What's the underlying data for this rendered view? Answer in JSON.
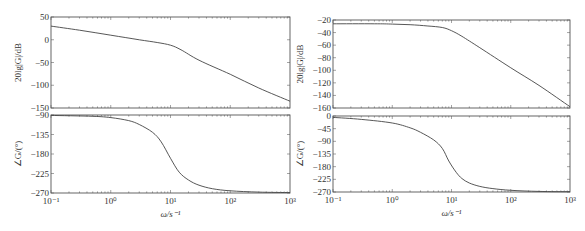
{
  "chart_data": [
    {
      "type": "line",
      "panel": "left-magnitude",
      "title": "",
      "xlabel": "",
      "ylabel": "20lg|G|/dB",
      "xscale": "log",
      "xlim": [
        0.1,
        1000
      ],
      "ylim": [
        -150,
        50
      ],
      "yticks": [
        50,
        0,
        -50,
        -100,
        -150
      ],
      "grid": false,
      "series": [
        {
          "name": "magnitude",
          "x": [
            0.1,
            0.3,
            1,
            3,
            6,
            10,
            15,
            30,
            100,
            300,
            1000
          ],
          "y": [
            30,
            21,
            10,
            0,
            -6,
            -12,
            -22,
            -45,
            -76,
            -106,
            -135
          ]
        }
      ]
    },
    {
      "type": "line",
      "panel": "left-phase",
      "xlabel": "ω/s⁻¹",
      "ylabel": "∠G/(°)",
      "xscale": "log",
      "xlim": [
        0.1,
        1000
      ],
      "ylim": [
        -270,
        -90
      ],
      "yticks": [
        -90,
        -135,
        -180,
        -225,
        -270
      ],
      "xticks": [
        "10⁻¹",
        "10⁰",
        "10¹",
        "10²",
        "10³"
      ],
      "grid": false,
      "series": [
        {
          "name": "phase",
          "x": [
            0.1,
            0.5,
            1,
            2,
            3,
            5,
            7,
            10,
            14,
            20,
            30,
            50,
            100,
            300,
            1000
          ],
          "y": [
            -91,
            -93,
            -96,
            -103,
            -112,
            -130,
            -152,
            -190,
            -222,
            -240,
            -252,
            -260,
            -265,
            -268,
            -269
          ]
        }
      ]
    },
    {
      "type": "line",
      "panel": "right-magnitude",
      "xlabel": "",
      "ylabel": "20lg|G|/dB",
      "xscale": "log",
      "xlim": [
        0.1,
        1000
      ],
      "ylim": [
        -160,
        -20
      ],
      "yticks": [
        -20,
        -40,
        -60,
        -80,
        -100,
        -120,
        -140,
        -160
      ],
      "grid": false,
      "series": [
        {
          "name": "magnitude",
          "x": [
            0.1,
            0.5,
            1,
            2,
            4,
            7,
            10,
            15,
            30,
            100,
            300,
            1000
          ],
          "y": [
            -26,
            -26,
            -26.5,
            -27.5,
            -29.5,
            -32,
            -37,
            -46,
            -64,
            -96,
            -124,
            -158
          ]
        }
      ]
    },
    {
      "type": "line",
      "panel": "right-phase",
      "xlabel": "ω/s⁻¹",
      "ylabel": "∠G/(°)",
      "xscale": "log",
      "xlim": [
        0.1,
        1000
      ],
      "ylim": [
        -270,
        0
      ],
      "yticks": [
        0,
        -45,
        -90,
        -135,
        -180,
        -225,
        -270
      ],
      "xticks": [
        "10⁻¹",
        "10⁰",
        "10¹",
        "10²",
        "10³"
      ],
      "grid": false,
      "series": [
        {
          "name": "phase",
          "x": [
            0.1,
            0.3,
            1,
            2,
            3,
            5,
            7,
            9,
            12,
            15,
            20,
            30,
            50,
            100,
            300,
            1000
          ],
          "y": [
            -5,
            -12,
            -25,
            -42,
            -58,
            -85,
            -115,
            -160,
            -200,
            -222,
            -238,
            -250,
            -258,
            -264,
            -268,
            -269
          ]
        }
      ]
    }
  ],
  "labels": {
    "mag_ylabel": "20lg|G|/dB",
    "phase_ylabel": "∠G/(°)",
    "xlabel": "ω/s⁻¹"
  },
  "colors": {
    "curve": "#444444",
    "frame": "#555555",
    "text": "#333333"
  }
}
